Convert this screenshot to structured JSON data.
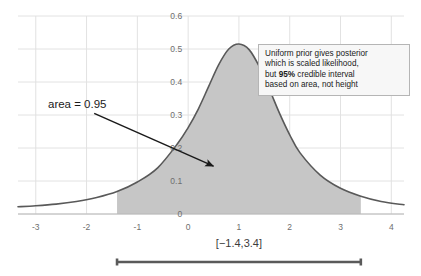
{
  "chart_data": {
    "type": "area",
    "title": "",
    "subtitle": "",
    "xlabel": "",
    "ylabel": "",
    "xlim": [
      -3.35,
      4.25
    ],
    "ylim": [
      0,
      0.6
    ],
    "grid": true,
    "legend_position": "none",
    "x_ticks": [
      "-3",
      "-2",
      "-1",
      "0",
      "1",
      "2",
      "3",
      "4"
    ],
    "x_tick_values": [
      -3,
      -2,
      -1,
      0,
      1,
      2,
      3,
      4
    ],
    "y_ticks": [
      "0",
      "0.1",
      "0.2",
      "0.3",
      "0.4",
      "0.5",
      "0.6"
    ],
    "y_tick_values": [
      0,
      0.1,
      0.2,
      0.3,
      0.4,
      0.5,
      0.6
    ],
    "series": [
      {
        "name": "posterior",
        "description": "scaled likelihood posterior density, peak 0.515 at x = 1",
        "peak_x": 1.0,
        "peak_y": 0.515,
        "x": [
          -3.35,
          -3.0,
          -2.6,
          -2.2,
          -1.8,
          -1.4,
          -1.0,
          -0.6,
          -0.2,
          0.0,
          0.2,
          0.4,
          0.6,
          0.8,
          1.0,
          1.2,
          1.4,
          1.6,
          1.8,
          2.0,
          2.2,
          2.6,
          3.0,
          3.4,
          3.8,
          4.25
        ],
        "y": [
          0.022,
          0.025,
          0.03,
          0.038,
          0.05,
          0.068,
          0.097,
          0.14,
          0.215,
          0.262,
          0.318,
          0.385,
          0.452,
          0.5,
          0.515,
          0.498,
          0.447,
          0.378,
          0.305,
          0.24,
          0.186,
          0.118,
          0.078,
          0.054,
          0.038,
          0.028
        ]
      }
    ],
    "shaded_region": {
      "label": "95% credible interval",
      "x_start": -1.4,
      "x_end": 3.4,
      "area": 0.95,
      "fill_color": "#c6c6c6"
    },
    "annotations": [
      {
        "name": "area-annotation",
        "text": "area = 0.95",
        "arrow_from": [
          -1.85,
          0.305
        ],
        "arrow_to": [
          0.5,
          0.145
        ]
      }
    ],
    "colors": {
      "curve": "#595959",
      "fill": "#c6c6c6",
      "grid": "#e2e2e2",
      "axis": "#b8b8b8",
      "tick_text": "#6e6e6e",
      "annotation_text": "#1a1a1a",
      "interval_bar": "#5a5a5a",
      "callout_border": "#b5b5b5",
      "callout_background": "#f7f7f7"
    }
  },
  "callout": {
    "name": "posterior-note",
    "line1": "Uniform prior gives posterior",
    "line2": "which is scaled likelihood,",
    "line3_prefix": "but ",
    "line3_bold": "95%",
    "line3_suffix": " credible interval",
    "line4": "based on area, not height"
  },
  "interval": {
    "label": "[−1.4,3.4]",
    "start_value": -1.4,
    "end_value": 3.4
  },
  "annotation": {
    "area_label": "area = 0.95"
  }
}
